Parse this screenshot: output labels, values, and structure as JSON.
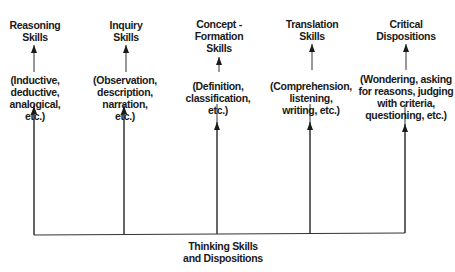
{
  "diagram": {
    "root": {
      "lines": [
        "Thinking Skills",
        "and Dispositions"
      ]
    },
    "branches": [
      {
        "title": [
          "Reasoning",
          "Skills"
        ],
        "examples": [
          "(Inductive,",
          "deductive,",
          "analogical,",
          "etc.)"
        ]
      },
      {
        "title": [
          "Inquiry",
          "Skills"
        ],
        "examples": [
          "(Observation,",
          "description,",
          "narration,",
          "etc.)"
        ]
      },
      {
        "title": [
          "Concept -",
          "Formation",
          "Skills"
        ],
        "examples": [
          "(Definition,",
          "classification,",
          "etc.)"
        ]
      },
      {
        "title": [
          "Translation",
          "Skills"
        ],
        "examples": [
          "(Comprehension,",
          "listening,",
          "writing, etc.)"
        ]
      },
      {
        "title": [
          "Critical",
          "Dispositions"
        ],
        "examples": [
          "(Wondering, asking",
          "for reasons, judging",
          "with criteria,",
          "questioning, etc.)"
        ]
      }
    ]
  }
}
